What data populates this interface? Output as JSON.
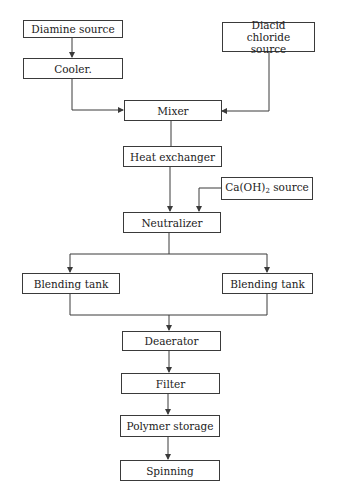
{
  "diagram": {
    "type": "process-flowchart",
    "line_color": "#3a3a3a",
    "nodes": [
      {
        "id": "diamine",
        "label": "Diamine source"
      },
      {
        "id": "cooler",
        "label": "Cooler."
      },
      {
        "id": "diacid",
        "label": "Diacid chloride source"
      },
      {
        "id": "mixer",
        "label": "Mixer"
      },
      {
        "id": "heat",
        "label": "Heat exchanger"
      },
      {
        "id": "caoh",
        "label_main": "Ca(OH)",
        "label_sub": "2",
        "label_tail": " source"
      },
      {
        "id": "neutralizer",
        "label": "Neutralizer"
      },
      {
        "id": "blend_left",
        "label": "Blending tank"
      },
      {
        "id": "blend_right",
        "label": "Blending tank"
      },
      {
        "id": "deaerator",
        "label": "Deaerator"
      },
      {
        "id": "filter",
        "label": "Filter"
      },
      {
        "id": "storage",
        "label": "Polymer storage"
      },
      {
        "id": "spinning",
        "label": "Spinning"
      }
    ],
    "edges": [
      {
        "from": "diamine",
        "to": "cooler"
      },
      {
        "from": "cooler",
        "to": "mixer"
      },
      {
        "from": "diacid",
        "to": "mixer"
      },
      {
        "from": "mixer",
        "to": "heat"
      },
      {
        "from": "heat",
        "to": "neutralizer"
      },
      {
        "from": "caoh",
        "to": "neutralizer"
      },
      {
        "from": "neutralizer",
        "to": "blend_left"
      },
      {
        "from": "neutralizer",
        "to": "blend_right"
      },
      {
        "from": "blend_left",
        "to": "deaerator"
      },
      {
        "from": "blend_right",
        "to": "deaerator"
      },
      {
        "from": "deaerator",
        "to": "filter"
      },
      {
        "from": "filter",
        "to": "storage"
      },
      {
        "from": "storage",
        "to": "spinning"
      }
    ]
  }
}
